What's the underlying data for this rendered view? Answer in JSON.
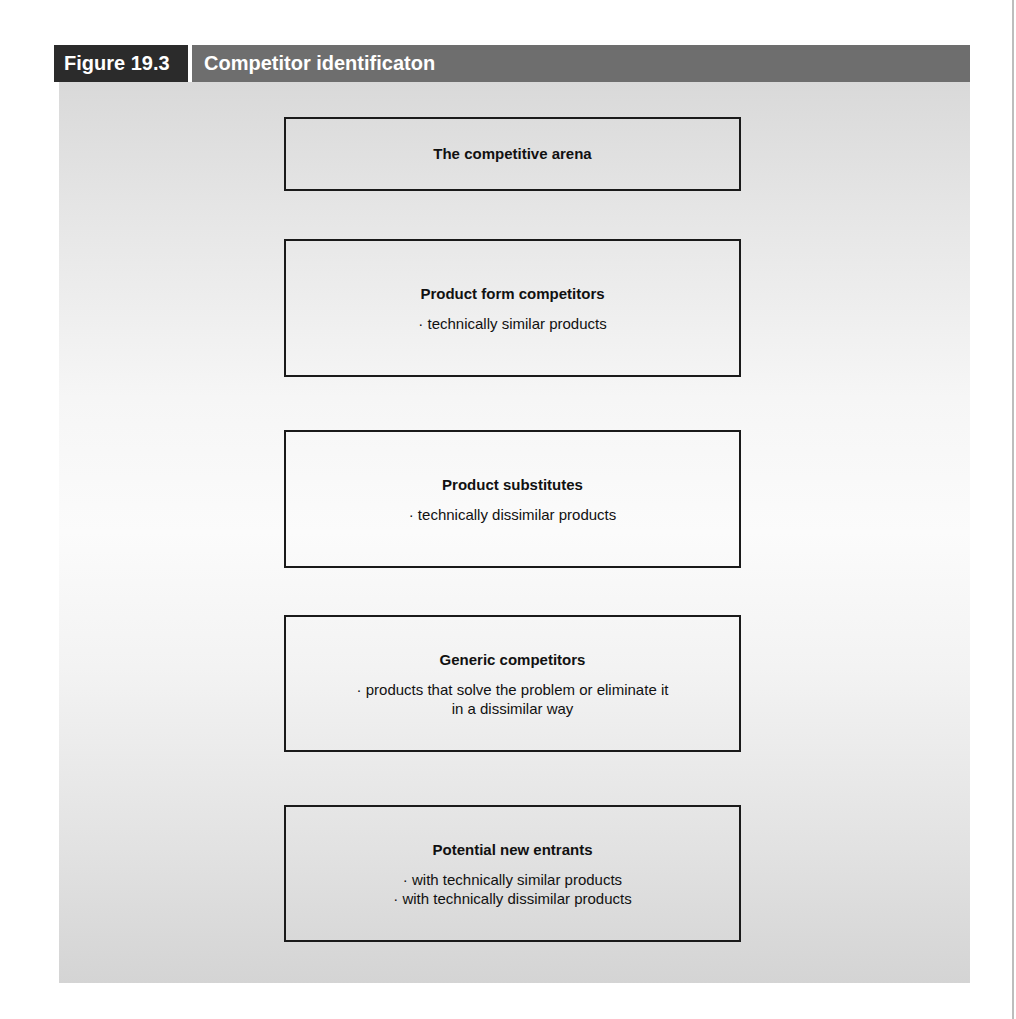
{
  "figure": {
    "number": "Figure 19.3",
    "title": "Competitor identificaton"
  },
  "colors": {
    "header_number_bg": "#2b2b2b",
    "header_title_bg": "#6e6e6e",
    "box_border": "#1a1a1a",
    "text": "#111111"
  },
  "boxes": [
    {
      "title": "The competitive arena",
      "items": []
    },
    {
      "title": "Product form competitors",
      "items": [
        "· technically similar products"
      ]
    },
    {
      "title": "Product substitutes",
      "items": [
        "· technically dissimilar products"
      ]
    },
    {
      "title": "Generic competitors",
      "items": [
        "· products that solve the problem or eliminate it",
        "in a dissimilar way"
      ]
    },
    {
      "title": "Potential new entrants",
      "items": [
        "· with technically similar products",
        "· with technically dissimilar products"
      ]
    }
  ]
}
